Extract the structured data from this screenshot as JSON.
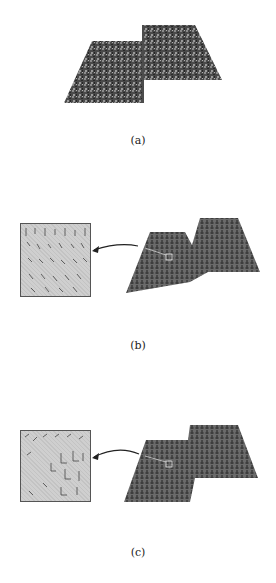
{
  "figure": {
    "panels": [
      {
        "id": "a",
        "label": "(a)",
        "description": "noisy step surface"
      },
      {
        "id": "b",
        "label": "(b)",
        "description": "smoothed step surface with needle normals, magnified inset"
      },
      {
        "id": "c",
        "label": "(c)",
        "description": "step surface with needle normals, magnified inset"
      }
    ],
    "colors": {
      "background": "#ffffff",
      "surface_dark": "#3a3a3a",
      "surface_mid": "#6e6e6e",
      "inset_fill": "#cfcfcf",
      "stroke": "#222222"
    }
  }
}
